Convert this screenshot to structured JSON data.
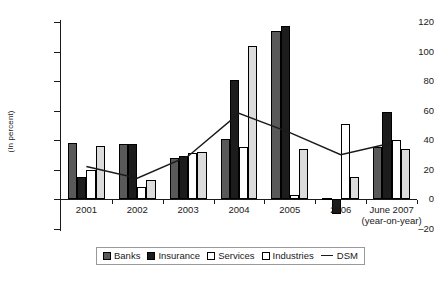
{
  "chart_data": {
    "type": "bar",
    "title": "",
    "subtitle": "",
    "xlabel": "",
    "ylabel": "(In percent)",
    "ylim": [
      -20,
      120
    ],
    "ytick_labels": [
      "120",
      "100",
      "80",
      "60",
      "40",
      "20",
      "0",
      "–20"
    ],
    "ytick_values": [
      120,
      100,
      80,
      60,
      40,
      20,
      0,
      -20
    ],
    "grid": false,
    "legend_position": "bottom",
    "categories": [
      "2001",
      "2002",
      "2003",
      "2004",
      "2005",
      "2006",
      "June 2007"
    ],
    "category_sublabels": [
      "",
      "",
      "",
      "",
      "",
      "",
      "(year-on-year)"
    ],
    "series": [
      {
        "name": "Banks",
        "type": "bar",
        "color": "#595959",
        "values": [
          38,
          37,
          28,
          41,
          114,
          1,
          35
        ]
      },
      {
        "name": "Insurance",
        "type": "bar",
        "color": "#1c1c1c",
        "values": [
          15,
          37,
          29,
          81,
          117,
          -10,
          59
        ]
      },
      {
        "name": "Services",
        "type": "bar",
        "color": "#ffffff",
        "values": [
          20,
          8,
          31,
          35,
          3,
          51,
          40
        ]
      },
      {
        "name": "Industries",
        "type": "bar",
        "color": "#dcdcdc",
        "values": [
          36,
          13,
          32,
          104,
          34,
          15,
          34
        ]
      },
      {
        "name": "DSM",
        "type": "line",
        "color": "#1a1a1a",
        "values": [
          22,
          14,
          29,
          58,
          45,
          30,
          38
        ]
      }
    ]
  },
  "legend": {
    "items": [
      {
        "label": "Banks"
      },
      {
        "label": "Insurance"
      },
      {
        "label": "Services"
      },
      {
        "label": "Industries"
      },
      {
        "label": "DSM"
      }
    ]
  }
}
